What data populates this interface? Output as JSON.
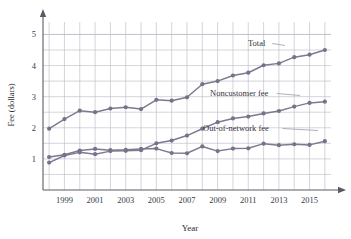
{
  "chart_data": {
    "type": "line",
    "title": "",
    "xlabel": "Year",
    "ylabel": "Fee (dollars)",
    "xlim": [
      1997.6,
      2016.4
    ],
    "ylim": [
      0,
      5.4
    ],
    "grid": true,
    "legend_position": "inline-labels",
    "x": [
      1998,
      1999,
      2000,
      2001,
      2002,
      2003,
      2004,
      2005,
      2006,
      2007,
      2008,
      2009,
      2010,
      2011,
      2012,
      2013,
      2014,
      2015,
      2016
    ],
    "xtick_labels": [
      "1999",
      "2001",
      "2003",
      "2005",
      "2007",
      "2009",
      "2011",
      "2013",
      "2015"
    ],
    "xtick_values": [
      1999,
      2001,
      2003,
      2005,
      2007,
      2009,
      2011,
      2013,
      2015
    ],
    "ytick_labels": [
      "1",
      "2",
      "3",
      "4",
      "5"
    ],
    "ytick_values": [
      1,
      2,
      3,
      4,
      5
    ],
    "series": [
      {
        "name": "Total",
        "label": "Total",
        "color": "#73738a",
        "values": [
          1.97,
          2.28,
          2.55,
          2.5,
          2.62,
          2.66,
          2.6,
          2.9,
          2.87,
          2.98,
          3.4,
          3.5,
          3.68,
          3.77,
          4.01,
          4.07,
          4.27,
          4.35,
          4.5
        ]
      },
      {
        "name": "Noncustomer fee",
        "label": "Noncustomer fee",
        "color": "#73738a",
        "values": [
          0.88,
          1.11,
          1.21,
          1.15,
          1.25,
          1.26,
          1.28,
          1.5,
          1.59,
          1.75,
          1.97,
          2.18,
          2.3,
          2.36,
          2.46,
          2.54,
          2.68,
          2.8,
          2.84
        ]
      },
      {
        "name": "Out-of-network fee",
        "label": "Out-of-network fee",
        "color": "#73738a",
        "values": [
          1.06,
          1.13,
          1.27,
          1.32,
          1.28,
          1.29,
          1.32,
          1.33,
          1.19,
          1.18,
          1.4,
          1.25,
          1.33,
          1.34,
          1.49,
          1.44,
          1.47,
          1.45,
          1.57
        ]
      }
    ],
    "annotations": [
      {
        "name": "total-label",
        "text": "Total",
        "x_px": 248,
        "y_px": 46,
        "leader_to_x_px": 285,
        "leader_to_y_px": 48
      },
      {
        "name": "noncustomer-label",
        "text": "Noncustomer fee",
        "x_px": 210,
        "y_px": 96,
        "leader_to_x_px": 300,
        "leader_to_y_px": 98
      },
      {
        "name": "outofnetwork-label",
        "text": "Out-of-network fee",
        "x_px": 203,
        "y_px": 131,
        "leader_to_x_px": 318,
        "leader_to_y_px": 133
      }
    ],
    "marker": "circle",
    "marker_size_px": 2.1
  }
}
